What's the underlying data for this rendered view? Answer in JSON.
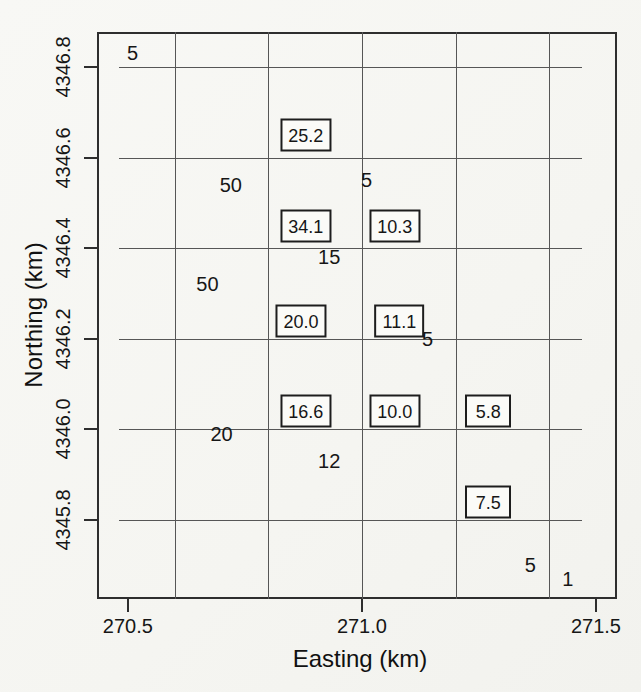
{
  "page": {
    "background": "#f7f7f4",
    "ink": "#161616",
    "grid_color": "#565656"
  },
  "chart_data": {
    "type": "scatter",
    "title": "",
    "xlabel": "Easting (km)",
    "ylabel": "Northing (km)",
    "xlim": [
      270.434,
      271.545
    ],
    "ylim": [
      4345.626,
      4346.877
    ],
    "grid": "on",
    "legend": "none",
    "x_ticks": [
      {
        "value": 270.5,
        "label": "270.5"
      },
      {
        "value": 271.0,
        "label": "271.0"
      },
      {
        "value": 271.5,
        "label": "271.5"
      }
    ],
    "y_ticks": [
      {
        "value": 4346.8,
        "label": "4346.8"
      },
      {
        "value": 4346.6,
        "label": "4346.6"
      },
      {
        "value": 4346.4,
        "label": "4346.4"
      },
      {
        "value": 4346.2,
        "label": "4346.2"
      },
      {
        "value": 4346.0,
        "label": "4346.0"
      },
      {
        "value": 4345.8,
        "label": "4345.8"
      }
    ],
    "gridlines": {
      "vertical_x": [
        270.6,
        270.8,
        271.0,
        271.2,
        271.4
      ],
      "horizontal_y": [
        4346.8,
        4346.6,
        4346.4,
        4346.2,
        4346.0,
        4345.8
      ],
      "horizontal_x_extent": [
        270.48,
        271.47
      ]
    },
    "series": [
      {
        "name": "boxed values",
        "marker": "boxed-label",
        "points": [
          {
            "x": 270.88,
            "y": 4346.65,
            "label": "25.2"
          },
          {
            "x": 270.88,
            "y": 4346.45,
            "label": "34.1"
          },
          {
            "x": 271.07,
            "y": 4346.45,
            "label": "10.3"
          },
          {
            "x": 270.87,
            "y": 4346.24,
            "label": "20.0"
          },
          {
            "x": 271.08,
            "y": 4346.24,
            "label": "11.1"
          },
          {
            "x": 270.88,
            "y": 4346.04,
            "label": "16.6"
          },
          {
            "x": 271.07,
            "y": 4346.04,
            "label": "10.0"
          },
          {
            "x": 271.27,
            "y": 4346.04,
            "label": "5.8"
          },
          {
            "x": 271.27,
            "y": 4345.84,
            "label": "7.5"
          }
        ]
      },
      {
        "name": "plain values",
        "marker": "text-label",
        "points": [
          {
            "x": 270.51,
            "y": 4346.83,
            "label": "5"
          },
          {
            "x": 270.72,
            "y": 4346.54,
            "label": "50"
          },
          {
            "x": 271.01,
            "y": 4346.55,
            "label": "5"
          },
          {
            "x": 270.93,
            "y": 4346.38,
            "label": "15"
          },
          {
            "x": 270.67,
            "y": 4346.32,
            "label": "50"
          },
          {
            "x": 271.14,
            "y": 4346.2,
            "label": "5"
          },
          {
            "x": 270.7,
            "y": 4345.99,
            "label": "20"
          },
          {
            "x": 270.93,
            "y": 4345.93,
            "label": "12"
          },
          {
            "x": 271.36,
            "y": 4345.7,
            "label": "5"
          },
          {
            "x": 271.44,
            "y": 4345.67,
            "label": "1"
          }
        ]
      }
    ],
    "layout": {
      "plot_px": {
        "left": 97,
        "top": 32,
        "width": 520,
        "height": 567
      },
      "tick_len_px": 13,
      "x_tick_label_center_y_px": 626,
      "y_tick_label_center_x_px": 63,
      "x_title_center_px": [
        360,
        659
      ],
      "y_title_center_px": [
        34,
        315
      ]
    }
  }
}
